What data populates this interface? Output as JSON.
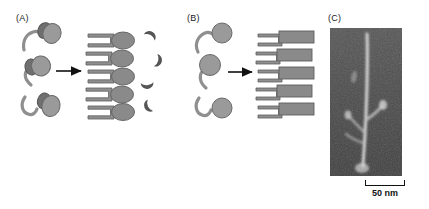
{
  "figure": {
    "background_color": "#ffffff",
    "width": 429,
    "height": 209
  },
  "panels": [
    {
      "id": "A",
      "label": "(A)",
      "reactant_count": 3,
      "reactant_type": "tadpole-molecule-with-cylinder-head",
      "arrow": "rightwards-arrow",
      "product_count": 5,
      "product_type": "bracket-with-oval-head",
      "byproduct_count": 4,
      "byproduct_type": "crescent"
    },
    {
      "id": "B",
      "label": "(B)",
      "reactant_count": 3,
      "reactant_type": "tadpole-molecule-with-oval-head",
      "arrow": "rightwards-arrow",
      "product_count": 5,
      "product_type": "bracket-with-rectangle",
      "byproduct_count": 0,
      "byproduct_type": ""
    },
    {
      "id": "C",
      "label": "(C)",
      "content_type": "electron-micrograph",
      "scale_bar": {
        "label": "50 nm",
        "value": 50,
        "unit": "nm"
      }
    }
  ],
  "colors": {
    "shape_fill": "#8f8f8f",
    "shape_fill_light": "#9a9a9a",
    "shape_fill_dark": "#6f6f6f",
    "shape_stroke": "#5a5a5a",
    "arrow": "#111111",
    "text": "#1a1a1a",
    "micrograph_background": "#4b4b4b",
    "micrograph_filament": "#c9c9c9"
  }
}
